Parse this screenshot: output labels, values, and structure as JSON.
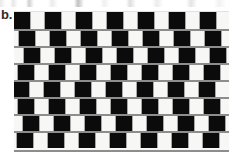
{
  "figure": {
    "label": "b.",
    "caption": "",
    "canvas": {
      "width": 243,
      "height": 154,
      "background": "#ffffff"
    }
  },
  "illusion": {
    "name": "cafe-wall",
    "tile_color_dark": "#0b0b0b",
    "tile_color_light": "#f7f7f5",
    "mortar_color": "#8d8d8d",
    "mortar_thickness_px": 2,
    "tile_width_px": 16,
    "tile_period_px": 31,
    "row_height_px": 17,
    "row_count": 8,
    "tiles_per_row": 8,
    "wall_left_px": 14,
    "wall_top_px": 12,
    "wall_width_px": 215,
    "wall_height_px": 138,
    "row_offsets_px": [
      0,
      5,
      10,
      4,
      -1,
      4,
      9,
      3
    ],
    "rows": [
      {
        "index": 1,
        "offset_px": 0,
        "has_mortar_above": false
      },
      {
        "index": 2,
        "offset_px": 5,
        "has_mortar_above": true
      },
      {
        "index": 3,
        "offset_px": 10,
        "has_mortar_above": true
      },
      {
        "index": 4,
        "offset_px": 4,
        "has_mortar_above": true
      },
      {
        "index": 5,
        "offset_px": -1,
        "has_mortar_above": true
      },
      {
        "index": 6,
        "offset_px": 4,
        "has_mortar_above": true
      },
      {
        "index": 7,
        "offset_px": 9,
        "has_mortar_above": true
      },
      {
        "index": 8,
        "offset_px": 3,
        "has_mortar_above": true
      }
    ]
  }
}
